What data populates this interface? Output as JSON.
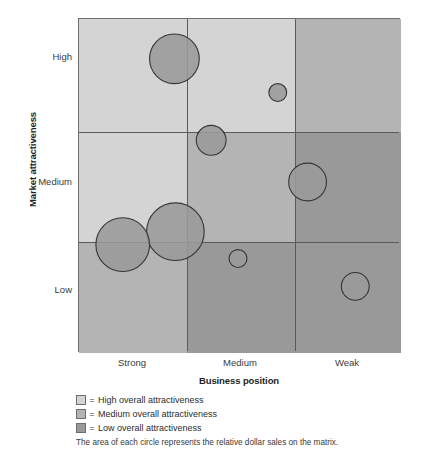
{
  "chart_data": {
    "type": "scatter",
    "title": "",
    "xlabel": "Business position",
    "ylabel": "Market attractiveness",
    "x_categories": [
      "Strong",
      "Medium",
      "Weak"
    ],
    "y_categories": [
      "High",
      "Medium",
      "Low"
    ],
    "grid": true,
    "legend_position": "below",
    "note": "The area of each circle represents the relative dollar sales on the matrix.",
    "cell_shading": [
      [
        "high",
        "high",
        "medium"
      ],
      [
        "high",
        "medium",
        "low"
      ],
      [
        "medium",
        "low",
        "low"
      ]
    ],
    "bubbles": [
      {
        "id": "bubble-1",
        "cx": 174,
        "cy": 58,
        "r": 25,
        "x_band": "Strong",
        "y_band": "High"
      },
      {
        "id": "bubble-2",
        "cx": 278,
        "cy": 92,
        "r": 9,
        "x_band": "Medium",
        "y_band": "High"
      },
      {
        "id": "bubble-3",
        "cx": 211,
        "cy": 140,
        "r": 15,
        "x_band": "Medium",
        "y_band": "Medium"
      },
      {
        "id": "bubble-4",
        "cx": 308,
        "cy": 182,
        "r": 19,
        "x_band": "Weak",
        "y_band": "Medium"
      },
      {
        "id": "bubble-5",
        "cx": 175,
        "cy": 232,
        "r": 29,
        "x_band": "Strong",
        "y_band": "Medium"
      },
      {
        "id": "bubble-6",
        "cx": 122,
        "cy": 245,
        "r": 27,
        "x_band": "Strong",
        "y_band": "Low"
      },
      {
        "id": "bubble-7",
        "cx": 238,
        "cy": 259,
        "r": 9,
        "x_band": "Medium",
        "y_band": "Low"
      },
      {
        "id": "bubble-8",
        "cx": 356,
        "cy": 287,
        "r": 14,
        "x_band": "Weak",
        "y_band": "Low"
      }
    ]
  },
  "axes": {
    "y_title": "Market attractiveness",
    "x_title": "Business position",
    "y_ticks": [
      {
        "label": "High"
      },
      {
        "label": "Medium"
      },
      {
        "label": "Low"
      }
    ],
    "x_ticks": [
      {
        "label": "Strong"
      },
      {
        "label": "Medium"
      },
      {
        "label": "Weak"
      }
    ]
  },
  "legend": {
    "items": [
      {
        "swatch": "high",
        "equals": "=",
        "label": "High overall attractiveness",
        "color": "#d4d4d4"
      },
      {
        "swatch": "medium",
        "equals": "=",
        "label": "Medium overall attractiveness",
        "color": "#b4b4b4"
      },
      {
        "swatch": "low",
        "equals": "=",
        "label": "Low overall attractiveness",
        "color": "#999999"
      }
    ]
  },
  "footnote": {
    "text": "The area of each circle represents the relative dollar sales on the matrix."
  },
  "colors": {
    "shade_high": "#d4d4d4",
    "shade_medium": "#b4b4b4",
    "shade_low": "#999999",
    "bubble_fill": "#9a9a9a",
    "bubble_stroke": "#353535",
    "grid_line": "#5a5a5a",
    "text": "#231f20"
  }
}
